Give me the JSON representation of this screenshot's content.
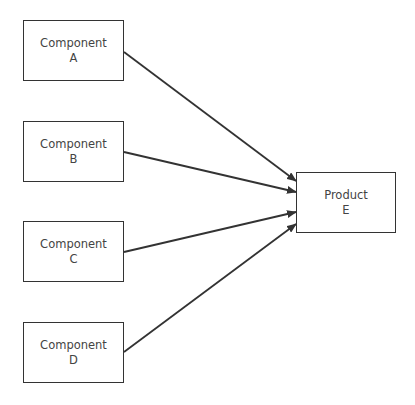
{
  "diagram": {
    "components": [
      {
        "id": "A",
        "line1": "Component",
        "line2": "A"
      },
      {
        "id": "B",
        "line1": "Component",
        "line2": "B"
      },
      {
        "id": "C",
        "line1": "Component",
        "line2": "C"
      },
      {
        "id": "D",
        "line1": "Component",
        "line2": "D"
      }
    ],
    "product": {
      "id": "E",
      "line1": "Product",
      "line2": "E"
    },
    "edges": [
      {
        "from": "A",
        "to": "E"
      },
      {
        "from": "B",
        "to": "E"
      },
      {
        "from": "C",
        "to": "E"
      },
      {
        "from": "D",
        "to": "E"
      }
    ],
    "colors": {
      "stroke": "#333333",
      "text": "#444444",
      "background": "#ffffff"
    }
  }
}
